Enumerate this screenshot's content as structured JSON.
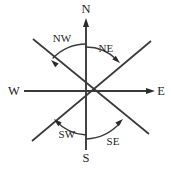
{
  "figure": {
    "kind": "compass-rose-diagram",
    "background_color": "#ffffff",
    "line_color": "#3a3a3a",
    "text_color": "#1e1e1e",
    "width": 171,
    "height": 173,
    "center": {
      "x": 86,
      "y": 91
    }
  },
  "cardinals": {
    "north": {
      "label": "N",
      "label_x": 86,
      "label_y": 13,
      "line": {
        "x1": 86,
        "y1": 91,
        "x2": 86,
        "y2": 22
      },
      "has_arrowhead": true,
      "arrow_tip": {
        "x": 86,
        "y": 18
      }
    },
    "south": {
      "label": "S",
      "label_x": 86,
      "label_y": 162,
      "line": {
        "x1": 86,
        "y1": 91,
        "x2": 86,
        "y2": 150
      },
      "has_arrowhead": false,
      "arrow_tip": null
    },
    "west": {
      "label": "W",
      "label_x": 14,
      "label_y": 95,
      "line": {
        "x1": 86,
        "y1": 91,
        "x2": 24,
        "y2": 91
      },
      "has_arrowhead": false,
      "arrow_tip": null
    },
    "east": {
      "label": "E",
      "label_x": 161,
      "label_y": 95,
      "line": {
        "x1": 86,
        "y1": 91,
        "x2": 150,
        "y2": 91
      },
      "has_arrowhead": true,
      "arrow_tip": {
        "x": 155,
        "y": 91
      }
    }
  },
  "diagonals": [
    {
      "name": "northwest-southeast",
      "x1": 33,
      "y1": 39,
      "x2": 149,
      "y2": 134
    },
    {
      "name": "northeast-southwest",
      "x1": 151,
      "y1": 41,
      "x2": 32,
      "y2": 141
    }
  ],
  "angles": [
    {
      "id": "nw",
      "label": "NW",
      "label_x": 62,
      "label_y": 42,
      "arc_path": "M 86 44 A 47 47 0 0 0 53 58",
      "arrow_tip": {
        "x": 51,
        "y": 60
      },
      "arrow_angle_deg": 222
    },
    {
      "id": "ne",
      "label": "NE",
      "label_x": 106,
      "label_y": 52,
      "arc_path": "M 86 47 A 44 44 0 0 1 117 60",
      "arrow_tip": {
        "x": 120,
        "y": 63
      },
      "arrow_angle_deg": 42
    },
    {
      "id": "sw",
      "label": "SW",
      "label_x": 67,
      "label_y": 138,
      "arc_path": "M 86 135 A 44 44 0 0 1 56 121",
      "arrow_tip": {
        "x": 54,
        "y": 119
      },
      "arrow_angle_deg": 222
    },
    {
      "id": "se",
      "label": "SE",
      "label_x": 113,
      "label_y": 145,
      "arc_path": "M 86 139 A 49 49 0 0 0 120 123",
      "arrow_tip": {
        "x": 123,
        "y": 119
      },
      "arrow_angle_deg": 318
    }
  ]
}
